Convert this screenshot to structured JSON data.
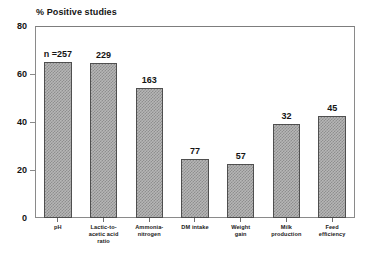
{
  "chart_data": {
    "type": "bar",
    "title": "% Positive studies",
    "xlabel": "",
    "ylabel": "",
    "ylim": [
      0,
      80
    ],
    "yticks": [
      0,
      20,
      40,
      60,
      80
    ],
    "ytick_labels": [
      "0",
      "20",
      "40",
      "60",
      "80"
    ],
    "grid": false,
    "legend": "none",
    "categories": [
      "pH",
      "Lactic-to-acetic acid ratio",
      "Ammonia-nitrogen",
      "DM intake",
      "Weight gain",
      "Milk production",
      "Feed efficiency"
    ],
    "category_lines": [
      [
        "pH"
      ],
      [
        "Lactic-to-",
        "acetic acid",
        "ratio"
      ],
      [
        "Ammonia-",
        "nitrogen"
      ],
      [
        "DM intake"
      ],
      [
        "Weight",
        "gain"
      ],
      [
        "Milk",
        "production"
      ],
      [
        "Feed",
        "efficiency"
      ]
    ],
    "values": [
      65,
      64.5,
      54,
      24.5,
      22.5,
      39,
      42.5
    ],
    "point_labels": [
      "n =257",
      "229",
      "163",
      "77",
      "57",
      "32",
      "45"
    ],
    "point_label_meaning": "number of studies (n) for each response variable",
    "bar_fill": "#b6b6b6",
    "bar_hatch": "cross-hatch",
    "bar_edge_color": "#4f4f4f",
    "axis_color": "#8a8a8a",
    "text_color": "#141414"
  }
}
